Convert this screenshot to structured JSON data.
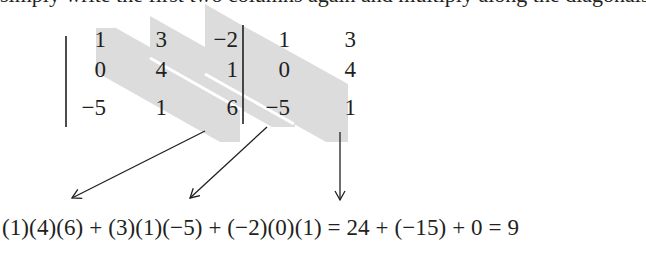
{
  "intro_text_clipped": "simply write the first two columns again and multiply along the diagonals to form the products.",
  "matrix": {
    "rows": [
      [
        "1",
        "3",
        "−2"
      ],
      [
        "0",
        "4",
        "1"
      ],
      [
        "−5",
        "1",
        "6"
      ]
    ],
    "repeated_columns": [
      [
        "1",
        "3"
      ],
      [
        "0",
        "4"
      ],
      [
        "−5",
        "1"
      ]
    ]
  },
  "diagonals": [
    {
      "elements": [
        "1",
        "4",
        "6"
      ]
    },
    {
      "elements": [
        "3",
        "1",
        "−5"
      ]
    },
    {
      "elements": [
        "−2",
        "0",
        "1"
      ]
    }
  ],
  "colors": {
    "band_fill": "#dcdcdc",
    "ink": "#231f20"
  },
  "equation": "(1)(4)(6) + (3)(1)(−5) + (−2)(0)(1) = 24 + (−15) + 0 = 9"
}
